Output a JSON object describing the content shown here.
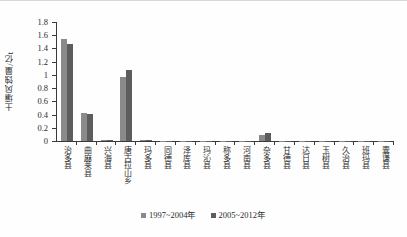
{
  "chart_data": {
    "type": "bar",
    "title": "",
    "xlabel": "",
    "ylabel": "土壤风蚀量/亿t",
    "ylim": [
      0,
      1.8
    ],
    "ytick_values": [
      0,
      0.2,
      0.4,
      0.6,
      0.8,
      1,
      1.2,
      1.4,
      1.6,
      1.8
    ],
    "ytick_labels": [
      "0",
      "0.2",
      "0.4",
      "0.6",
      "0.8",
      "1",
      "1.2",
      "1.4",
      "1.6",
      "1.8"
    ],
    "grid": false,
    "legend_position": "bottom",
    "categories": [
      "治多县",
      "曲麻莱县",
      "兴海县",
      "唐古拉山乡",
      "玛多县",
      "同德县",
      "泽库县",
      "玛沁县",
      "称多县",
      "河南县",
      "杂多县",
      "甘德县",
      "达日县",
      "玉树县",
      "久治县",
      "班玛县",
      "囊谦县"
    ],
    "series": [
      {
        "name": "1997~2004年",
        "color": "#8a8a8a",
        "values": [
          1.54,
          0.42,
          0.02,
          0.97,
          0.01,
          0.005,
          0.004,
          0.004,
          0.003,
          0.003,
          0.09,
          0.004,
          0.003,
          0.003,
          0.002,
          0.002,
          0.002
        ]
      },
      {
        "name": "2005~2012年",
        "color": "#5d5d5d",
        "values": [
          1.47,
          0.41,
          0.02,
          1.08,
          0.012,
          0.005,
          0.004,
          0.004,
          0.003,
          0.003,
          0.12,
          0.004,
          0.003,
          0.003,
          0.002,
          0.002,
          0.002
        ]
      }
    ]
  },
  "legend": {
    "items": [
      {
        "label": "1997~2004年",
        "color": "#8a8a8a"
      },
      {
        "label": "2005~2012年",
        "color": "#5d5d5d"
      }
    ]
  }
}
